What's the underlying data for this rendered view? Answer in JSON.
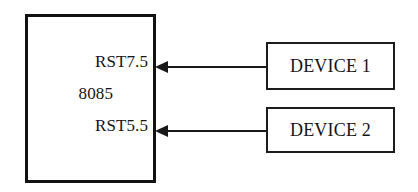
{
  "diagram": {
    "background_color": "#ffffff",
    "line_color": "#181818",
    "text_color": "#151515",
    "cpu": {
      "name": "cpu-block",
      "chip_label": "8085",
      "pins": [
        {
          "label": "RST7.5"
        },
        {
          "label": "RST5.5"
        }
      ]
    },
    "devices": [
      {
        "label": "DEVICE 1"
      },
      {
        "label": "DEVICE 2"
      }
    ],
    "connections": [
      {
        "from": "DEVICE 1",
        "to": "RST7.5",
        "direction": "left",
        "style": "solid-arrow"
      },
      {
        "from": "DEVICE 2",
        "to": "RST5.5",
        "direction": "left",
        "style": "solid-arrow"
      }
    ]
  }
}
